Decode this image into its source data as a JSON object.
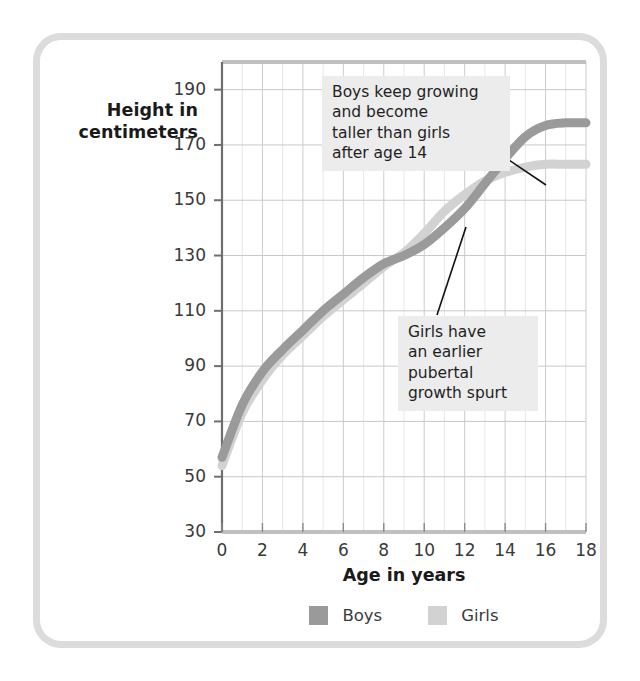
{
  "chart_data": {
    "type": "line",
    "title": "",
    "xlabel": "Age in years",
    "ylabel": "Height in centimeters",
    "xlim": [
      0,
      18
    ],
    "ylim": [
      30,
      200
    ],
    "xticks": [
      0,
      2,
      4,
      6,
      8,
      10,
      12,
      14,
      16,
      18
    ],
    "yticks": [
      30,
      50,
      70,
      90,
      110,
      130,
      150,
      170,
      190
    ],
    "grid": true,
    "legend_position": "bottom",
    "x": [
      0,
      1,
      2,
      3,
      4,
      5,
      6,
      7,
      8,
      9,
      10,
      11,
      12,
      13,
      14,
      15,
      16,
      17,
      18
    ],
    "series": [
      {
        "name": "Boys",
        "color": "#9a9a9a",
        "values": [
          57,
          76,
          88,
          96,
          103,
          110,
          116,
          122,
          127,
          130,
          134,
          140,
          147,
          156,
          165,
          173,
          177,
          178,
          178
        ]
      },
      {
        "name": "Girls",
        "color": "#d2d2d2",
        "values": [
          54,
          73,
          85,
          94,
          101,
          108,
          114,
          120,
          126,
          131,
          138,
          146,
          152,
          157,
          160,
          162,
          163,
          163,
          163
        ]
      }
    ],
    "annotations": [
      {
        "id": "boys-note",
        "text": "Boys keep growing\nand become\ntaller than girls\nafter age 14",
        "pointer_target_age": 16.0,
        "pointer_target_height": 172
      },
      {
        "id": "girls-note",
        "text": "Girls have\nan earlier\npubertal\ngrowth spurt",
        "pointer_target_age": 12.0,
        "pointer_target_height": 153
      }
    ]
  },
  "ylabel_lines": {
    "line1": "Height in",
    "line2": "centimeters"
  },
  "legend": {
    "items": [
      {
        "label": "Boys",
        "color": "#9a9a9a"
      },
      {
        "label": "Girls",
        "color": "#d2d2d2"
      }
    ]
  },
  "colors": {
    "frame": "#dcdcdc",
    "grid": "#c9c9c9",
    "axis": "#6f6f6f",
    "annotation_background": "#ececec",
    "text": "#1f1f1f"
  }
}
